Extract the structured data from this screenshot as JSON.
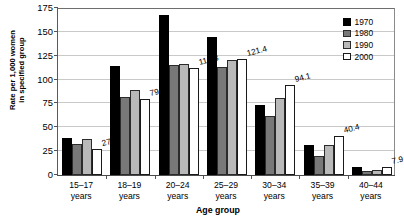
{
  "chart_data": {
    "type": "bar",
    "title": "",
    "subtitle": "",
    "xlabel": "Age group",
    "ylabel": "Rate per 1,000 women\nin specified group",
    "categories": [
      "15–17\nyears",
      "18–19\nyears",
      "20–24\nyears",
      "25–29\nyears",
      "30–34\nyears",
      "35–39\nyears",
      "40–44\nyears"
    ],
    "category_names": [
      "15–17 years",
      "18–19 years",
      "20–24 years",
      "25–29 years",
      "30–34 years",
      "35–39 years",
      "40–44 years"
    ],
    "series": [
      {
        "name": "1970",
        "color": "#000000",
        "values": [
          38.8,
          114.7,
          167.8,
          145.1,
          73.3,
          31.7,
          8.1
        ]
      },
      {
        "name": "1980",
        "color": "#787878",
        "values": [
          32.5,
          82.1,
          115.1,
          112.9,
          61.9,
          19.8,
          3.9
        ]
      },
      {
        "name": "1990",
        "color": "#b9b9b9",
        "values": [
          37.5,
          88.6,
          116.5,
          120.2,
          80.8,
          31.7,
          5.5
        ]
      },
      {
        "name": "2000",
        "color": "#ffffff",
        "values": [
          27.4,
          79.2,
          112.3,
          121.4,
          94.1,
          40.4,
          7.9
        ]
      }
    ],
    "data_labels": [
      {
        "series": "2000",
        "category": "15–17 years",
        "text": "27.4"
      },
      {
        "series": "2000",
        "category": "18–19 years",
        "text": "79.2"
      },
      {
        "series": "2000",
        "category": "20–24 years",
        "text": "112.3"
      },
      {
        "series": "2000",
        "category": "25–29 years",
        "text": "121.4"
      },
      {
        "series": "2000",
        "category": "30–34 years",
        "text": "94.1"
      },
      {
        "series": "2000",
        "category": "35–39 years",
        "text": "40.4"
      },
      {
        "series": "2000",
        "category": "40–44 years",
        "text": "7.9"
      }
    ],
    "ylim": [
      0,
      175
    ],
    "yticks": [
      0,
      25,
      50,
      75,
      100,
      125,
      150,
      175
    ],
    "ytick_labels": [
      "0",
      "25",
      "50",
      "75",
      "100",
      "125",
      "150",
      "175"
    ],
    "grid": true,
    "legend_position": "top-right",
    "legend_entries": [
      "1970",
      "1980",
      "1990",
      "2000"
    ]
  }
}
